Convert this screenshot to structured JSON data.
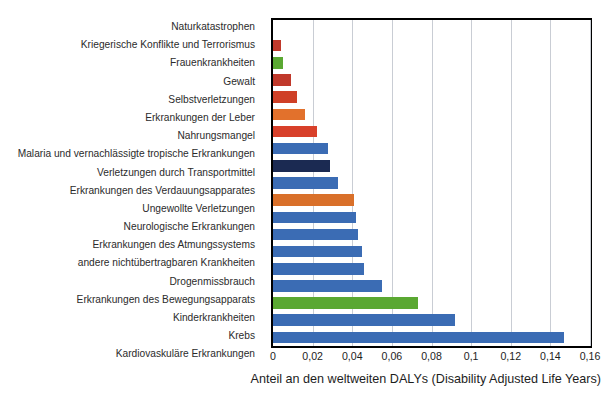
{
  "chart_data": {
    "type": "bar",
    "orientation": "horizontal",
    "title": "",
    "xlabel": "Anteil an den weltweiten DALYs (Disability Adjusted Life Years)",
    "ylabel": "",
    "xlim": [
      0,
      0.16
    ],
    "xticks": [
      0,
      0.02,
      0.04,
      0.06,
      0.08,
      0.1,
      0.12,
      0.14,
      0.16
    ],
    "xtick_labels": [
      "0",
      "0,02",
      "0,04",
      "0,06",
      "0,08",
      "0,1",
      "0,12",
      "0,14",
      "0,16"
    ],
    "grid": "vertical",
    "legend": "none",
    "decimal_separator": ",",
    "categories": [
      "Naturkatastrophen",
      "Kriegerische Konflikte und Terrorismus",
      "Frauenkrankheiten",
      "Gewalt",
      "Selbstverletzungen",
      "Erkrankungen der Leber",
      "Nahrungsmangel",
      "Malaria und vernachlässigte tropische Erkrankungen",
      "Verletzungen durch Transportmittel",
      "Erkrankungen des Verdauungsapparates",
      "Ungewollte Verletzungen",
      "Neurologische Erkrankungen",
      "Erkrankungen des Atmungssystems",
      "andere nichtübertragbaren Krankheiten",
      "Drogenmissbrauch",
      "Erkrankungen des Bewegungsapparats",
      "Kinderkrankheiten",
      "Krebs",
      "Kardiovaskuläre Erkrankungen"
    ],
    "values": [
      0.0,
      0.004,
      0.005,
      0.009,
      0.012,
      0.016,
      0.022,
      0.028,
      0.029,
      0.033,
      0.041,
      0.042,
      0.043,
      0.045,
      0.046,
      0.055,
      0.073,
      0.092,
      0.147
    ],
    "bar_colors": [
      "#c0392b",
      "#c0392b",
      "#5aa832",
      "#c0392b",
      "#cf4027",
      "#e2712c",
      "#d8402a",
      "#3b6cb4",
      "#1b2a52",
      "#3b6cb4",
      "#d9702a",
      "#3b6cb4",
      "#3b6cb4",
      "#3b6cb4",
      "#3b6cb4",
      "#3b6cb4",
      "#5aa832",
      "#3b6cb4",
      "#3b6cb4"
    ]
  },
  "colors": {
    "blue": "#3b6cb4",
    "dark_navy": "#1b2a52",
    "green": "#5aa832",
    "red": "#c0392b",
    "orange": "#e2712c",
    "grid": "#c9cdd4",
    "axis": "#000000",
    "background": "#ffffff"
  }
}
